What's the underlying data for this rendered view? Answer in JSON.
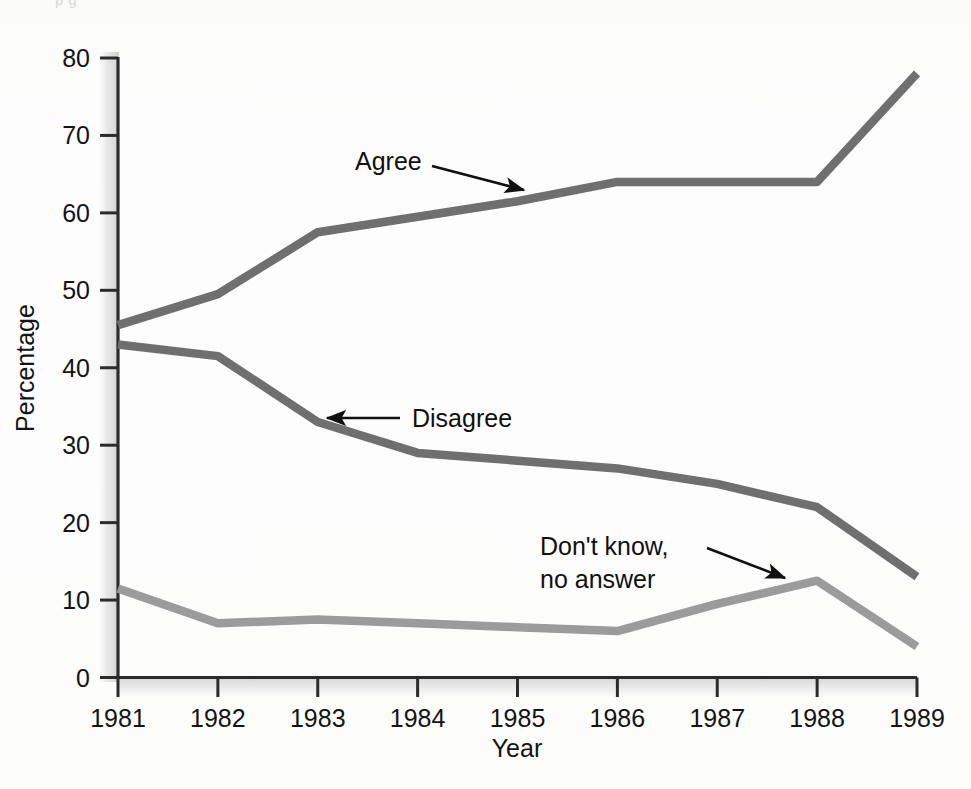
{
  "chart_data": {
    "type": "line",
    "title": "",
    "xlabel": "Year",
    "ylabel": "Percentage",
    "x": [
      1981,
      1982,
      1983,
      1984,
      1985,
      1986,
      1987,
      1988,
      1989
    ],
    "xtick_labels": [
      "1981",
      "1982",
      "1983",
      "1984",
      "1985",
      "1986",
      "1987",
      "1988",
      "1989"
    ],
    "ytick_labels": [
      "0",
      "10",
      "20",
      "30",
      "40",
      "50",
      "60",
      "70",
      "80"
    ],
    "yticks": [
      0,
      10,
      20,
      30,
      40,
      50,
      60,
      70,
      80
    ],
    "ylim": [
      0,
      80
    ],
    "xlim": [
      1981,
      1989
    ],
    "grid": false,
    "legend_position": "inline-annotations",
    "series": [
      {
        "name": "Agree",
        "color": "#6f6f6f",
        "values": [
          45.5,
          49.5,
          57.5,
          59.5,
          61.5,
          64.0,
          64.0,
          64.0,
          78.0
        ]
      },
      {
        "name": "Disagree",
        "color": "#6f6f6f",
        "values": [
          43.0,
          41.5,
          33.0,
          29.0,
          28.0,
          27.0,
          25.0,
          22.0,
          13.0
        ]
      },
      {
        "name": "Don't know, no answer",
        "color": "#9b9b9b",
        "values": [
          11.5,
          7.0,
          7.5,
          7.0,
          6.5,
          6.0,
          9.5,
          12.5,
          4.0
        ]
      }
    ],
    "annotations": [
      {
        "id": "agree",
        "text": "Agree",
        "lines": [
          "Agree"
        ],
        "text_x": 355,
        "text_y": 170,
        "arrow_from_x": 432,
        "arrow_from_y": 166,
        "arrow_to_x": 524,
        "arrow_to_y": 190
      },
      {
        "id": "disagree",
        "text": "Disagree",
        "lines": [
          "Disagree"
        ],
        "text_x": 412,
        "text_y": 427,
        "arrow_from_x": 400,
        "arrow_from_y": 418,
        "arrow_to_x": 327,
        "arrow_to_y": 418
      },
      {
        "id": "dont-know",
        "text": "Don't know, no answer",
        "lines": [
          "Don't know,",
          "no answer"
        ],
        "text_x": 540,
        "text_y": 555,
        "arrow_from_x": 707,
        "arrow_from_y": 548,
        "arrow_to_x": 785,
        "arrow_to_y": 578
      }
    ]
  },
  "axes": {
    "y_axis_label": "Percentage",
    "x_axis_label": "Year"
  },
  "artifact": {
    "top_clipped_caption": "p                                        g"
  }
}
